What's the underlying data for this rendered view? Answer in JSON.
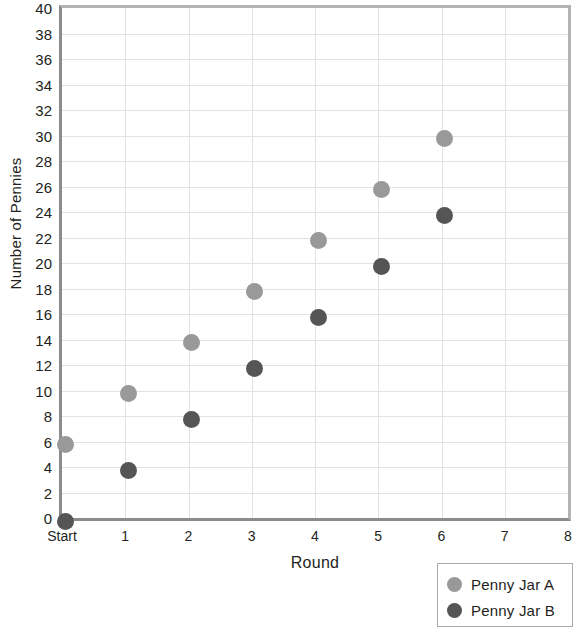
{
  "chart_data": {
    "type": "scatter",
    "title": "",
    "xlabel": "Round",
    "ylabel": "Number of Pennies",
    "x": [
      "Start",
      "1",
      "2",
      "3",
      "4",
      "5",
      "6"
    ],
    "x_numeric": [
      0,
      1,
      2,
      3,
      4,
      5,
      6
    ],
    "xtick_labels": [
      "Start",
      "1",
      "2",
      "3",
      "4",
      "5",
      "6",
      "7",
      "8"
    ],
    "xtick_values": [
      0,
      1,
      2,
      3,
      4,
      5,
      6,
      7,
      8
    ],
    "xlim": [
      0,
      8
    ],
    "ytick_labels": [
      "0",
      "2",
      "4",
      "6",
      "8",
      "10",
      "12",
      "14",
      "16",
      "18",
      "20",
      "22",
      "24",
      "26",
      "28",
      "30",
      "32",
      "34",
      "36",
      "38",
      "40"
    ],
    "ytick_values": [
      0,
      2,
      4,
      6,
      8,
      10,
      12,
      14,
      16,
      18,
      20,
      22,
      24,
      26,
      28,
      30,
      32,
      34,
      36,
      38,
      40
    ],
    "ylim": [
      0,
      40
    ],
    "grid": true,
    "legend_position": "bottom-right",
    "series": [
      {
        "name": "Penny Jar A",
        "color": "#999999",
        "values": [
          6,
          10,
          14,
          18,
          22,
          26,
          30
        ]
      },
      {
        "name": "Penny Jar B",
        "color": "#555555",
        "values": [
          0,
          4,
          8,
          12,
          16,
          20,
          24
        ]
      }
    ]
  },
  "legend": {
    "entries": [
      {
        "label": "Penny Jar A",
        "color": "#999999"
      },
      {
        "label": "Penny Jar B",
        "color": "#555555"
      }
    ]
  },
  "colors": {
    "jar_a": "#999999",
    "jar_b": "#555555",
    "grid": "#e2e2e2",
    "axis": "#8c8c8c",
    "text": "#231f20"
  }
}
